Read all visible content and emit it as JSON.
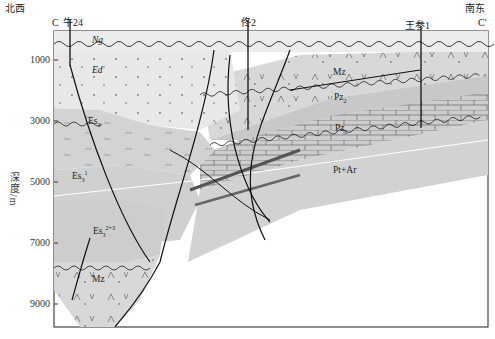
{
  "figure": {
    "left_end_label": "C",
    "right_end_label": "C'",
    "left_direction": "北西",
    "right_direction": "南东",
    "y_axis_label": "深度/m",
    "y_ticks": [
      "1000",
      "3000",
      "5000",
      "7000",
      "9000"
    ]
  },
  "wells": [
    {
      "name": "牛24"
    },
    {
      "name": "佟2"
    },
    {
      "name": "王参1"
    }
  ],
  "units": {
    "ng": "Ng",
    "ed": "Ed",
    "es3": "Es",
    "es3_sub": "3",
    "es3_1": "Es",
    "es3_1_sub": "3",
    "es3_1_sup": "1",
    "es3_23": "Es",
    "es3_23_sub": "3",
    "es3_23_sup": "2+3",
    "mz_top": "Mz",
    "mz_bottom": "Mz",
    "pz2": "Pz",
    "pz2_sub": "2",
    "pz1": "Pz",
    "pz1_sub": "1",
    "pt_ar": "Pt+Ar"
  },
  "colors": {
    "light_fill": "#e6e6e6",
    "mid_fill": "#cfcfcf",
    "dark_fill": "#bdbdbd",
    "line": "#1a1a1a"
  }
}
